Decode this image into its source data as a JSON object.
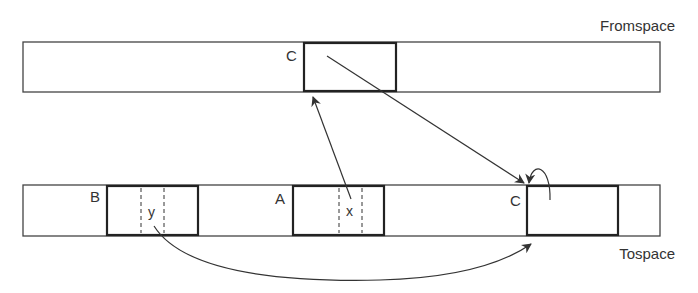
{
  "diagram": {
    "fromspace": {
      "label": "Fromspace",
      "objects": [
        {
          "name": "C",
          "label": "C"
        }
      ]
    },
    "tospace": {
      "label": "Tospace",
      "objects": [
        {
          "name": "B",
          "label": "B",
          "field": "y"
        },
        {
          "name": "A",
          "label": "A",
          "field": "x"
        },
        {
          "name": "C",
          "label": "C"
        }
      ]
    },
    "arrows": [
      {
        "from": "A.x",
        "to": "Fromspace C"
      },
      {
        "from": "Fromspace C",
        "to": "Tospace C",
        "meaning": "forwarding pointer"
      },
      {
        "from": "B.y",
        "to": "Tospace C"
      },
      {
        "from": "Tospace C",
        "to": "Tospace C",
        "meaning": "self loop"
      }
    ],
    "colors": {
      "stroke": "#333333",
      "background": "#ffffff"
    }
  }
}
